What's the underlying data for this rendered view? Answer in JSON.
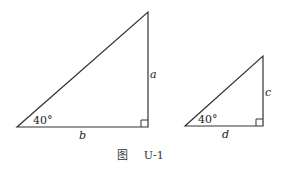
{
  "figure": {
    "caption_prefix": "图",
    "caption_id": "U-1"
  },
  "triangles": [
    {
      "name": "large",
      "angle_label": "40°",
      "base_label": "b",
      "height_label": "a",
      "vertices": {
        "left": [
          17,
          127
        ],
        "right": [
          148,
          127
        ],
        "top": [
          148,
          12
        ]
      }
    },
    {
      "name": "small",
      "angle_label": "40°",
      "base_label": "d",
      "height_label": "c",
      "vertices": {
        "left": [
          185,
          126
        ],
        "right": [
          263,
          126
        ],
        "top": [
          263,
          56
        ]
      }
    }
  ],
  "colors": {
    "stroke": "#333333",
    "background": "#ffffff"
  }
}
